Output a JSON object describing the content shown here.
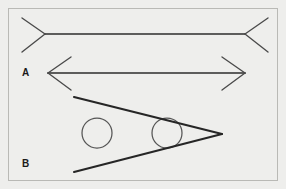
{
  "figure": {
    "width": 286,
    "height": 189,
    "background_color": "#eeeeec",
    "border_color": "#b9b9b5",
    "line_color": "#2c2c2c",
    "fin_color": "#4a4a4a",
    "circle_color": "#555555"
  },
  "labels": {
    "panel_a": "A",
    "panel_b": "B"
  },
  "chart_data": {
    "type": "diagram",
    "panels": [
      {
        "id": "top",
        "label": "",
        "description": "Horizontal shaft with outward-pointing fins at both ends",
        "shaft": {
          "x1": 45,
          "y1": 34,
          "x2": 245,
          "y2": 34,
          "length": 200
        },
        "fins": [
          {
            "end": "left",
            "direction": "outward",
            "x1": 45,
            "y1": 34,
            "x2": 22,
            "y2": 18
          },
          {
            "end": "left",
            "direction": "outward",
            "x1": 45,
            "y1": 34,
            "x2": 22,
            "y2": 52
          },
          {
            "end": "right",
            "direction": "outward",
            "x1": 245,
            "y1": 34,
            "x2": 268,
            "y2": 18
          },
          {
            "end": "right",
            "direction": "outward",
            "x1": 245,
            "y1": 34,
            "x2": 268,
            "y2": 52
          }
        ]
      },
      {
        "id": "A",
        "label": "A",
        "description": "Horizontal shaft with inward-pointing fins at both ends",
        "shaft": {
          "x1": 48,
          "y1": 73,
          "x2": 245,
          "y2": 73,
          "length": 197
        },
        "fins": [
          {
            "end": "left",
            "direction": "inward",
            "x1": 48,
            "y1": 73,
            "x2": 71,
            "y2": 57
          },
          {
            "end": "left",
            "direction": "inward",
            "x1": 48,
            "y1": 73,
            "x2": 71,
            "y2": 90
          },
          {
            "end": "right",
            "direction": "inward",
            "x1": 245,
            "y1": 73,
            "x2": 222,
            "y2": 57
          },
          {
            "end": "right",
            "direction": "inward",
            "x1": 245,
            "y1": 73,
            "x2": 222,
            "y2": 90
          }
        ]
      },
      {
        "id": "B",
        "label": "B",
        "description": "Converging wedge opening to the left with two equal circles inside",
        "wedge": {
          "apex": {
            "x": 222,
            "y": 134
          },
          "upper_arm_end": {
            "x": 74,
            "y": 97
          },
          "lower_arm_end": {
            "x": 74,
            "y": 172
          }
        },
        "circles": [
          {
            "id": "circle-left",
            "cx": 97,
            "cy": 133,
            "r": 15,
            "position": "wide-end"
          },
          {
            "id": "circle-right",
            "cx": 167,
            "cy": 133,
            "r": 15,
            "position": "narrow-end"
          }
        ],
        "note": "Both circles have identical radius"
      }
    ]
  }
}
